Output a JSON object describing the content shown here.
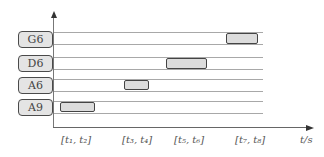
{
  "diagram": {
    "type": "gantt-timeline",
    "rows": [
      {
        "label": "G6",
        "interval": "[t7, t8]"
      },
      {
        "label": "D6",
        "interval": "[t5, t6]"
      },
      {
        "label": "A6",
        "interval": "[t3, t4]"
      },
      {
        "label": "A9",
        "interval": "[t1, t2]"
      }
    ],
    "x_ticks": [
      "[t₁, t₂]",
      "[t₃, t₄]",
      "[t₅, t₆]",
      "[t₇, t₈]"
    ],
    "x_unit": "t/s",
    "colors": {
      "box_fill": "#e4e4e4",
      "box_border": "#4a4a4a",
      "grid_line": "#a8a8a8",
      "axis": "#666666"
    }
  }
}
